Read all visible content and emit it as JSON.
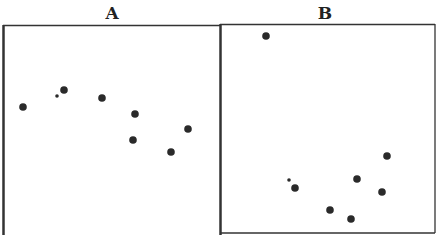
{
  "chart_data": [
    {
      "type": "scatter",
      "title": "A",
      "xlabel": "",
      "ylabel": "",
      "grid": false,
      "legend": null,
      "note": "Pixel coordinates within a 438x235 image (y increases downward); no axis ticks shown",
      "points": [
        {
          "x": 23,
          "y": 107,
          "size": "large"
        },
        {
          "x": 57,
          "y": 96,
          "size": "small"
        },
        {
          "x": 64,
          "y": 90,
          "size": "large"
        },
        {
          "x": 102,
          "y": 98,
          "size": "large"
        },
        {
          "x": 135,
          "y": 114,
          "size": "large"
        },
        {
          "x": 133,
          "y": 140,
          "size": "large"
        },
        {
          "x": 188,
          "y": 129,
          "size": "large"
        },
        {
          "x": 171,
          "y": 152,
          "size": "large"
        }
      ]
    },
    {
      "type": "scatter",
      "title": "B",
      "xlabel": "",
      "ylabel": "",
      "grid": false,
      "legend": null,
      "note": "Pixel coordinates within a 438x235 image (y increases downward); no axis ticks shown",
      "points": [
        {
          "x": 266,
          "y": 36,
          "size": "large"
        },
        {
          "x": 289,
          "y": 180,
          "size": "small"
        },
        {
          "x": 295,
          "y": 188,
          "size": "large"
        },
        {
          "x": 330,
          "y": 210,
          "size": "large"
        },
        {
          "x": 351,
          "y": 219,
          "size": "large"
        },
        {
          "x": 357,
          "y": 179,
          "size": "large"
        },
        {
          "x": 382,
          "y": 192,
          "size": "large"
        },
        {
          "x": 387,
          "y": 156,
          "size": "large"
        }
      ]
    }
  ],
  "panels": {
    "a": {
      "label": "A"
    },
    "b": {
      "label": "B"
    }
  },
  "colors": {
    "frame": "#333333",
    "dot": "#2a2a2a"
  }
}
